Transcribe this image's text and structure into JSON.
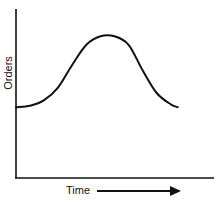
{
  "chart_data": {
    "type": "line",
    "title": "",
    "xlabel": "Time",
    "ylabel": "Orders",
    "x_axis_arrow": true,
    "grid": false,
    "legend": null,
    "ticks": {
      "x": [],
      "y": []
    },
    "note": "Conceptual curve without numeric scale; values are relative estimates (0-100).",
    "x": [
      0,
      10,
      20,
      30,
      40,
      50,
      60,
      70,
      80,
      90,
      100,
      110,
      115
    ],
    "series": [
      {
        "name": "Orders",
        "values": [
          50,
          51,
          55,
          64,
          80,
          94,
          100,
          100,
          94,
          76,
          60,
          52,
          50
        ]
      }
    ],
    "xlim": [
      0,
      140
    ],
    "ylim": [
      0,
      120
    ]
  },
  "labels": {
    "y_axis": "Orders",
    "x_axis": "Time"
  },
  "colors": {
    "line": "#111111",
    "axis": "#111111",
    "background": "#ffffff"
  }
}
